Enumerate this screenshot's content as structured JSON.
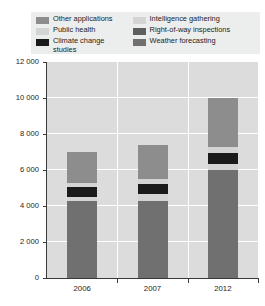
{
  "caption": {
    "top": "",
    "bottom": ""
  },
  "legend": {
    "position": "top",
    "items": [
      {
        "label": "Other  applications",
        "color": "#8d8d8d",
        "column": "left"
      },
      {
        "label": "Public health",
        "color": "#d4d4d4",
        "column": "left"
      },
      {
        "label": "Climate change\nstudies",
        "color": "#1b1b1b",
        "column": "left"
      },
      {
        "label": "Intelligence gathering",
        "color": "#d4d4d4",
        "column": "right"
      },
      {
        "label": "Right-of-way inspections",
        "color": "#5e5e5e",
        "column": "right"
      },
      {
        "label": "Weather forecasting",
        "color": "#707070",
        "column": "right"
      }
    ]
  },
  "yaxis": {
    "ticks": [
      "12 000",
      "10 000",
      "8 000",
      "6 000",
      "4 000",
      "2 000",
      "0"
    ],
    "values": [
      12000,
      10000,
      8000,
      6000,
      4000,
      2000,
      0
    ],
    "min": 0,
    "max": 12000,
    "step": 2000
  },
  "xaxis": {
    "labels": [
      "2006",
      "2007",
      "2012"
    ]
  },
  "colors": {
    "plot_background": "#dcdcdc",
    "gridline": "#ffffff",
    "axis": "#3a3a3a",
    "legend_background": "#eceded",
    "text": "#1c1c1c"
  },
  "chart_data": {
    "type": "bar",
    "stacked": true,
    "title": "",
    "subtitle": "",
    "xlabel": "",
    "ylabel": "",
    "ylim": [
      0,
      12000
    ],
    "ystep": 2000,
    "grid": true,
    "legend_position": "top",
    "categories": [
      "2006",
      "2007",
      "2012"
    ],
    "series": [
      {
        "name": "Weather forecasting",
        "color": "#707070",
        "values": [
          4300,
          4300,
          6000
        ]
      },
      {
        "name": "Right-of-way inspections",
        "color": "#d4d4d4",
        "values": [
          200,
          350,
          350
        ]
      },
      {
        "name": "Climate change studies",
        "color": "#1b1b1b",
        "values": [
          550,
          550,
          600
        ]
      },
      {
        "name": "Public health",
        "color": "#d4d4d4",
        "values": [
          250,
          300,
          350
        ]
      },
      {
        "name": "Other applications",
        "color": "#8d8d8d",
        "values": [
          1700,
          1900,
          2700
        ]
      }
    ],
    "totals": [
      7000,
      7400,
      10000
    ]
  }
}
